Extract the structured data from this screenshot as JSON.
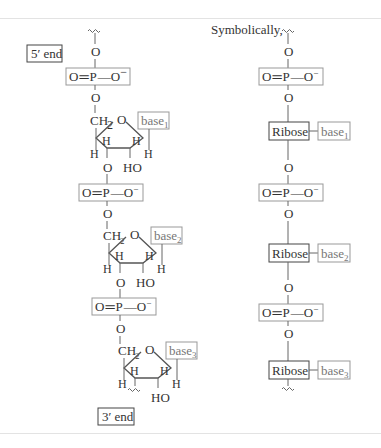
{
  "figure": {
    "title_right": "Symbolically,",
    "left_chain": {
      "five_prime_label": "5′ end",
      "three_prime_label": "3′ end",
      "phosphate": {
        "O_double": "O",
        "P": "P",
        "O_minus": "O",
        "charge": "−",
        "bond_double": "=",
        "bond_single": "—"
      },
      "bridge_oxygen": "O",
      "nucleotides": [
        {
          "ch2": "CH",
          "ch2_sub": "2",
          "ring_o": "O",
          "base": "base",
          "base_sub": "1",
          "h_labels": [
            "H",
            "H",
            "H",
            "H"
          ],
          "ho": "HO",
          "o3": "O"
        },
        {
          "ch2": "CH",
          "ch2_sub": "2",
          "ring_o": "O",
          "base": "base",
          "base_sub": "2",
          "h_labels": [
            "H",
            "H",
            "H",
            "H"
          ],
          "ho": "HO",
          "o3": "O"
        },
        {
          "ch2": "CH",
          "ch2_sub": "2",
          "ring_o": "O",
          "base": "base",
          "base_sub": "3",
          "h_labels": [
            "H",
            "H",
            "H",
            "H"
          ],
          "ho": "HO",
          "o3": ""
        }
      ]
    },
    "right_chain": {
      "units": [
        {
          "sugar": "Ribose",
          "base": "base",
          "base_sub": "1"
        },
        {
          "sugar": "Ribose",
          "base": "base",
          "base_sub": "2"
        },
        {
          "sugar": "Ribose",
          "base": "base",
          "base_sub": "3"
        }
      ],
      "phosphate": {
        "text": "O=P—O",
        "charge": "−"
      },
      "bridge_oxygen": "O"
    },
    "colors": {
      "rule": "#e3e3e3",
      "box_light": "#999999",
      "box_dark": "#444444",
      "text": "#333333",
      "base_text": "#777777"
    }
  }
}
